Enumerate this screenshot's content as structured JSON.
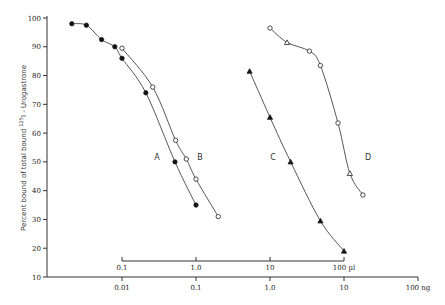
{
  "chart_data": {
    "type": "scatter",
    "title": "",
    "ylabel": "Percent bound of total bound 125I - Urogastrone",
    "ylabel_parts": {
      "prefix": "Percent bound of total bound ",
      "sup": "125",
      "suffix": "I - Urogastrone"
    },
    "ylim": [
      10,
      100
    ],
    "yticks": [
      10,
      20,
      30,
      40,
      50,
      60,
      70,
      80,
      90,
      100
    ],
    "x_axes": [
      {
        "name": "volume",
        "unit": "µl",
        "scale": "log",
        "ticks": [
          "0.1",
          "1.0",
          "10",
          "100 µl"
        ],
        "tick_values": [
          0.1,
          1,
          10,
          100
        ]
      },
      {
        "name": "mass",
        "unit": "ng",
        "scale": "log",
        "ticks": [
          "0.01",
          "0.1",
          "1.0",
          "10",
          "100 ng"
        ],
        "tick_values": [
          0.01,
          0.1,
          1,
          10,
          100
        ]
      }
    ],
    "grid": false,
    "legend": "inline curve labels A, B, C, D",
    "series": [
      {
        "name": "A",
        "marker": "filled-circle",
        "axis": "ng",
        "x": [
          0.0021,
          0.0033,
          0.0053,
          0.008,
          0.01,
          0.021,
          0.052,
          0.1
        ],
        "y": [
          98,
          97.5,
          92.5,
          90,
          86,
          74,
          50,
          35
        ]
      },
      {
        "name": "B",
        "marker": "open-circle",
        "axis": "ng",
        "x": [
          0.01,
          0.026,
          0.053,
          0.074,
          0.1,
          0.2
        ],
        "y": [
          89.5,
          76,
          57.5,
          51,
          44,
          31
        ]
      },
      {
        "name": "C",
        "marker": "filled-triangle",
        "axis": "µl",
        "x": [
          5.3,
          10,
          19,
          48,
          100
        ],
        "y": [
          81.5,
          65.5,
          50,
          29.5,
          19
        ]
      },
      {
        "name": "D",
        "marker": "open-triangle/open-circle",
        "axis": "ng",
        "x": [
          1.0,
          1.7,
          3.4,
          4.8,
          8.3,
          12,
          18
        ],
        "y": [
          96.5,
          91.5,
          88.5,
          83.5,
          63.5,
          46,
          38.5
        ]
      }
    ],
    "labels": [
      {
        "text": "A",
        "x_px": 157,
        "y_px": 160
      },
      {
        "text": "B",
        "x_px": 200,
        "y_px": 160
      },
      {
        "text": "C",
        "x_px": 273,
        "y_px": 160
      },
      {
        "text": "D",
        "x_px": 368,
        "y_px": 160
      }
    ]
  }
}
